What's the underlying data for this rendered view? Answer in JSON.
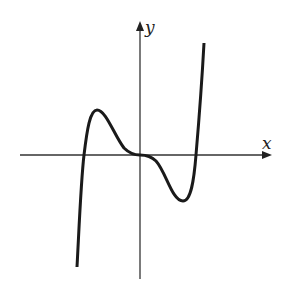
{
  "figure": {
    "axes": {
      "x_label": "x",
      "y_label": "y"
    },
    "colors": {
      "curve": "#1a1a1a",
      "axis": "#333333",
      "background": "#ffffff"
    },
    "features": {
      "roots": [
        "negative root",
        "0 (flat, tangent)",
        "positive root"
      ],
      "local_max": "left of origin, above x-axis",
      "local_min": "right of origin, below x-axis",
      "end_behavior": "falls to -infinity on left, rises to +infinity on right"
    }
  }
}
